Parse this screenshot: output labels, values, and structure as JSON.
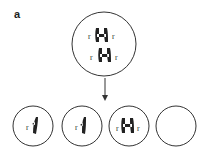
{
  "panel_label": "a",
  "parent_cell": {
    "chromosomes": [
      {
        "type": "replicated",
        "left_allele": "r",
        "right_allele": "r"
      },
      {
        "type": "replicated",
        "left_allele": "r",
        "right_allele": "r"
      }
    ]
  },
  "arrow": "down-arrow",
  "daughter_cells": [
    {
      "chromosomes": [
        {
          "type": "single",
          "left_allele": "r"
        }
      ]
    },
    {
      "chromosomes": [
        {
          "type": "single",
          "left_allele": "r"
        }
      ]
    },
    {
      "chromosomes": [
        {
          "type": "replicated",
          "left_allele": "r",
          "right_allele": "r"
        }
      ]
    },
    {
      "chromosomes": []
    }
  ],
  "colors": {
    "stroke": "#333333",
    "chromosome": "#222222",
    "background": "#ffffff"
  }
}
